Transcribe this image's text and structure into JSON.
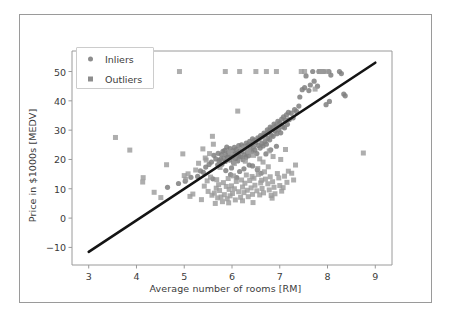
{
  "figure": {
    "background": "#ffffff",
    "border_color": "#9a9a9a"
  },
  "chart_data": {
    "type": "scatter",
    "title": "",
    "xlabel": "Average number of rooms [RM]",
    "ylabel": "Price in $1000s [MEDV]",
    "xlim": [
      2.65,
      9.35
    ],
    "ylim": [
      -16,
      57
    ],
    "xticks": [
      3,
      4,
      5,
      6,
      7,
      8,
      9
    ],
    "yticks": [
      -10,
      0,
      10,
      20,
      30,
      40,
      50
    ],
    "grid": false,
    "legend_position": "upper left",
    "colors": {
      "inlier": "#7f7f7f",
      "outlier": "#9a9a9a",
      "line": "#141414",
      "text": "#3b3b3b"
    },
    "series": [
      {
        "name": "Inliers",
        "marker": "circle",
        "color": "#7f7f7f",
        "points": [
          [
            4.65,
            10.5
          ],
          [
            4.88,
            11.8
          ],
          [
            5.02,
            12.6
          ],
          [
            5.14,
            13.9
          ],
          [
            5.28,
            14.2
          ],
          [
            5.34,
            16.1
          ],
          [
            5.4,
            15.6
          ],
          [
            5.45,
            17.4
          ],
          [
            5.52,
            18.3
          ],
          [
            5.57,
            19.1
          ],
          [
            5.6,
            13.4
          ],
          [
            5.62,
            21.4
          ],
          [
            5.66,
            20.2
          ],
          [
            5.7,
            18.2
          ],
          [
            5.71,
            22.1
          ],
          [
            5.73,
            19.6
          ],
          [
            5.76,
            20.1
          ],
          [
            5.78,
            21.7
          ],
          [
            5.79,
            18.4
          ],
          [
            5.81,
            22.8
          ],
          [
            5.83,
            20.4
          ],
          [
            5.85,
            23.1
          ],
          [
            5.86,
            19.3
          ],
          [
            5.88,
            21.5
          ],
          [
            5.89,
            24.2
          ],
          [
            5.91,
            20.8
          ],
          [
            5.93,
            22.4
          ],
          [
            5.95,
            19.8
          ],
          [
            5.96,
            23.7
          ],
          [
            5.98,
            21.2
          ],
          [
            6.0,
            20.6
          ],
          [
            6.02,
            22.9
          ],
          [
            6.03,
            18.9
          ],
          [
            6.05,
            24.1
          ],
          [
            6.06,
            21.8
          ],
          [
            6.08,
            20.3
          ],
          [
            6.09,
            23.4
          ],
          [
            6.11,
            22.2
          ],
          [
            6.12,
            19.5
          ],
          [
            6.14,
            24.7
          ],
          [
            6.15,
            21.1
          ],
          [
            6.17,
            23.0
          ],
          [
            6.18,
            20.9
          ],
          [
            6.2,
            25.0
          ],
          [
            6.21,
            22.6
          ],
          [
            6.23,
            19.9
          ],
          [
            6.24,
            24.4
          ],
          [
            6.26,
            21.6
          ],
          [
            6.27,
            23.8
          ],
          [
            6.29,
            20.7
          ],
          [
            6.3,
            25.6
          ],
          [
            6.32,
            22.3
          ],
          [
            6.33,
            24.9
          ],
          [
            6.35,
            21.3
          ],
          [
            6.37,
            26.2
          ],
          [
            6.38,
            23.5
          ],
          [
            6.4,
            25.1
          ],
          [
            6.42,
            22.7
          ],
          [
            6.43,
            27.0
          ],
          [
            6.45,
            24.3
          ],
          [
            6.47,
            26.5
          ],
          [
            6.48,
            23.2
          ],
          [
            6.5,
            25.8
          ],
          [
            6.52,
            22.0
          ],
          [
            6.54,
            27.4
          ],
          [
            6.55,
            24.8
          ],
          [
            6.57,
            26.9
          ],
          [
            6.59,
            23.9
          ],
          [
            6.6,
            28.1
          ],
          [
            6.62,
            25.4
          ],
          [
            6.64,
            27.7
          ],
          [
            6.65,
            24.6
          ],
          [
            6.67,
            29.0
          ],
          [
            6.69,
            26.1
          ],
          [
            6.7,
            28.5
          ],
          [
            6.72,
            25.2
          ],
          [
            6.74,
            30.1
          ],
          [
            6.75,
            27.2
          ],
          [
            6.77,
            29.4
          ],
          [
            6.79,
            26.7
          ],
          [
            6.8,
            31.0
          ],
          [
            6.82,
            28.3
          ],
          [
            6.84,
            30.6
          ],
          [
            6.86,
            27.9
          ],
          [
            6.88,
            32.1
          ],
          [
            6.9,
            29.7
          ],
          [
            6.92,
            31.5
          ],
          [
            6.94,
            28.8
          ],
          [
            6.96,
            33.0
          ],
          [
            6.98,
            30.2
          ],
          [
            7.0,
            32.5
          ],
          [
            7.02,
            29.1
          ],
          [
            7.04,
            33.8
          ],
          [
            7.06,
            31.2
          ],
          [
            7.08,
            34.5
          ],
          [
            7.1,
            30.8
          ],
          [
            7.12,
            33.4
          ],
          [
            7.14,
            35.2
          ],
          [
            7.16,
            32.0
          ],
          [
            7.18,
            36.1
          ],
          [
            7.2,
            33.6
          ],
          [
            7.24,
            35.8
          ],
          [
            7.28,
            34.2
          ],
          [
            7.31,
            37.0
          ],
          [
            7.35,
            36.4
          ],
          [
            7.4,
            38.2
          ],
          [
            7.42,
            41.3
          ],
          [
            7.47,
            43.8
          ],
          [
            7.52,
            44.5
          ],
          [
            7.55,
            48.5
          ],
          [
            7.61,
            43.5
          ],
          [
            7.64,
            45.4
          ],
          [
            7.69,
            50.0
          ],
          [
            7.72,
            46.7
          ],
          [
            7.79,
            45.0
          ],
          [
            7.82,
            50.0
          ],
          [
            7.85,
            50.0
          ],
          [
            7.88,
            50.0
          ],
          [
            7.92,
            50.0
          ],
          [
            7.97,
            38.7
          ],
          [
            8.03,
            50.0
          ],
          [
            8.04,
            39.8
          ],
          [
            8.07,
            48.8
          ],
          [
            8.25,
            50.0
          ],
          [
            8.29,
            49.3
          ],
          [
            8.34,
            42.3
          ],
          [
            8.37,
            41.7
          ],
          [
            6.43,
            17.8
          ],
          [
            6.53,
            16.5
          ],
          [
            6.61,
            15.3
          ],
          [
            5.99,
            17.1
          ],
          [
            6.25,
            16.8
          ],
          [
            6.36,
            18.1
          ],
          [
            5.87,
            16.2
          ],
          [
            6.16,
            15.9
          ],
          [
            6.71,
            21.9
          ],
          [
            6.81,
            23.3
          ],
          [
            6.93,
            24.5
          ],
          [
            5.97,
            14.8
          ],
          [
            6.1,
            13.8
          ]
        ]
      },
      {
        "name": "Outliers",
        "marker": "square",
        "color": "#9a9a9a",
        "points": [
          [
            3.56,
            27.5
          ],
          [
            3.86,
            23.2
          ],
          [
            4.13,
            12.3
          ],
          [
            4.14,
            13.8
          ],
          [
            4.37,
            8.8
          ],
          [
            4.51,
            7.0
          ],
          [
            4.63,
            18.2
          ],
          [
            4.9,
            50.0
          ],
          [
            4.97,
            21.9
          ],
          [
            5.0,
            14.5
          ],
          [
            5.03,
            13.2
          ],
          [
            5.08,
            15.1
          ],
          [
            5.12,
            7.4
          ],
          [
            5.18,
            8.2
          ],
          [
            5.24,
            16.4
          ],
          [
            5.3,
            18.7
          ],
          [
            5.36,
            6.3
          ],
          [
            5.39,
            23.6
          ],
          [
            5.44,
            20.5
          ],
          [
            5.48,
            12.7
          ],
          [
            5.5,
            9.1
          ],
          [
            5.53,
            22.0
          ],
          [
            5.55,
            14.0
          ],
          [
            5.58,
            7.8
          ],
          [
            5.59,
            27.9
          ],
          [
            5.61,
            25.2
          ],
          [
            5.63,
            8.5
          ],
          [
            5.65,
            5.0
          ],
          [
            5.67,
            10.2
          ],
          [
            5.68,
            13.1
          ],
          [
            5.7,
            6.9
          ],
          [
            5.72,
            11.4
          ],
          [
            5.74,
            9.4
          ],
          [
            5.75,
            17.3
          ],
          [
            5.77,
            7.2
          ],
          [
            5.8,
            5.6
          ],
          [
            5.82,
            12.1
          ],
          [
            5.84,
            8.0
          ],
          [
            5.86,
            50.0
          ],
          [
            5.88,
            10.8
          ],
          [
            5.9,
            6.6
          ],
          [
            5.92,
            13.5
          ],
          [
            5.94,
            9.8
          ],
          [
            5.96,
            7.6
          ],
          [
            5.99,
            11.0
          ],
          [
            6.01,
            8.4
          ],
          [
            6.03,
            14.4
          ],
          [
            6.05,
            10.0
          ],
          [
            6.07,
            6.2
          ],
          [
            6.09,
            12.5
          ],
          [
            6.12,
            36.5
          ],
          [
            6.14,
            9.0
          ],
          [
            6.16,
            50.0
          ],
          [
            6.18,
            7.1
          ],
          [
            6.2,
            13.0
          ],
          [
            6.22,
            10.6
          ],
          [
            6.25,
            8.7
          ],
          [
            6.27,
            11.9
          ],
          [
            6.3,
            14.7
          ],
          [
            6.32,
            9.5
          ],
          [
            6.34,
            7.3
          ],
          [
            6.37,
            12.8
          ],
          [
            6.4,
            10.3
          ],
          [
            6.43,
            8.1
          ],
          [
            6.46,
            13.6
          ],
          [
            6.48,
            11.2
          ],
          [
            6.5,
            50.0
          ],
          [
            6.52,
            9.3
          ],
          [
            6.55,
            14.9
          ],
          [
            6.58,
            7.9
          ],
          [
            6.6,
            12.0
          ],
          [
            6.63,
            10.1
          ],
          [
            6.66,
            8.6
          ],
          [
            6.68,
            15.8
          ],
          [
            6.7,
            13.3
          ],
          [
            6.72,
            50.0
          ],
          [
            6.75,
            11.7
          ],
          [
            6.78,
            9.6
          ],
          [
            6.8,
            14.1
          ],
          [
            6.82,
            7.7
          ],
          [
            6.85,
            12.4
          ],
          [
            6.88,
            10.5
          ],
          [
            6.9,
            8.3
          ],
          [
            6.93,
            50.0
          ],
          [
            6.95,
            15.2
          ],
          [
            6.98,
            13.7
          ],
          [
            7.0,
            11.1
          ],
          [
            7.04,
            9.2
          ],
          [
            7.07,
            10.4
          ],
          [
            7.1,
            14.3
          ],
          [
            7.15,
            12.2
          ],
          [
            7.25,
            15.3
          ],
          [
            7.33,
            18.1
          ],
          [
            7.45,
            50.0
          ],
          [
            7.52,
            50.0
          ],
          [
            7.74,
            44.0
          ],
          [
            7.83,
            50.0
          ],
          [
            7.87,
            50.0
          ],
          [
            7.9,
            50.0
          ],
          [
            8.0,
            50.0
          ],
          [
            8.75,
            22.2
          ],
          [
            6.25,
            23.9
          ],
          [
            6.35,
            22.6
          ],
          [
            6.45,
            21.4
          ],
          [
            6.58,
            20.2
          ],
          [
            6.65,
            19.1
          ],
          [
            6.78,
            22.9
          ],
          [
            6.86,
            21.0
          ],
          [
            7.02,
            20.0
          ],
          [
            7.12,
            23.4
          ],
          [
            5.42,
            10.9
          ],
          [
            5.46,
            19.8
          ],
          [
            6.42,
            14.2
          ],
          [
            6.54,
            16.9
          ],
          [
            6.76,
            17.5
          ],
          [
            7.18,
            16.0
          ],
          [
            6.28,
            19.4
          ],
          [
            5.96,
            22.4
          ],
          [
            6.05,
            18.6
          ],
          [
            6.62,
            12.9
          ],
          [
            7.29,
            13.0
          ],
          [
            6.84,
            6.8
          ],
          [
            6.44,
            5.3
          ],
          [
            5.93,
            5.2
          ],
          [
            6.22,
            5.9
          ]
        ]
      }
    ],
    "fit_line": {
      "name": "RANSAC regression line",
      "color": "#141414",
      "x_start": 3.0,
      "y_start": -11.5,
      "x_end": 9.0,
      "y_end": 53.0
    }
  },
  "legend": {
    "entries": [
      {
        "label": "Inliers",
        "marker": "circle",
        "color": "#8d8d8d"
      },
      {
        "label": "Outliers",
        "marker": "square",
        "color": "#8d8d8d"
      }
    ]
  }
}
